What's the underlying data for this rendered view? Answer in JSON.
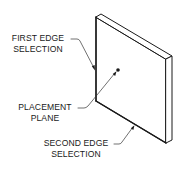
{
  "figure": {
    "type": "technical-illustration",
    "line_color": "#1a1a1a",
    "background": "#ffffff"
  },
  "labels": {
    "first_edge": {
      "line1": "FIRST EDGE",
      "line2": "SELECTION"
    },
    "placement_plane": {
      "line1": "PLACEMENT",
      "line2": "PLANE"
    },
    "second_edge": {
      "line1": "SECOND EDGE",
      "line2": "SELECTION"
    }
  }
}
